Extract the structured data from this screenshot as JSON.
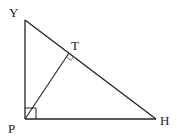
{
  "diagram": {
    "type": "right-triangle-with-altitude",
    "stroke_color": "#222222",
    "points": {
      "Y": {
        "label": "Y",
        "x": 25,
        "y": 20
      },
      "P": {
        "label": "P",
        "x": 25,
        "y": 119
      },
      "H": {
        "label": "H",
        "x": 156,
        "y": 119
      },
      "T": {
        "label": "T",
        "x": 69,
        "y": 53
      }
    },
    "segments": [
      "YP",
      "PH",
      "YH",
      "PT"
    ],
    "right_angles": [
      "YPH",
      "PTH"
    ]
  }
}
